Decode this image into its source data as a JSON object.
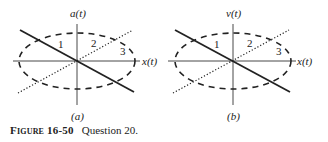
{
  "panels": [
    {
      "id": "a",
      "y_axis_label": "a(t)",
      "x_axis_label": "x(t)",
      "sub_label": "(a)",
      "curve_labels": [
        "1",
        "2",
        "3"
      ],
      "curves": [
        {
          "name": "1",
          "style": "solid",
          "description": "straight line, negative slope through origin"
        },
        {
          "name": "2",
          "style": "dotted",
          "description": "straight line, positive slope through origin"
        },
        {
          "name": "3",
          "style": "dashed",
          "description": "ellipse centered at origin"
        }
      ]
    },
    {
      "id": "b",
      "y_axis_label": "v(t)",
      "x_axis_label": "x(t)",
      "sub_label": "(b)",
      "curve_labels": [
        "1",
        "2",
        "3"
      ],
      "curves": [
        {
          "name": "1",
          "style": "solid",
          "description": "straight line, negative slope through origin"
        },
        {
          "name": "2",
          "style": "dotted",
          "description": "straight line, positive slope through origin"
        },
        {
          "name": "3",
          "style": "dashed",
          "description": "ellipse centered at origin"
        }
      ]
    }
  ],
  "caption": {
    "title": "Figure 16-50",
    "text": "Question 20."
  },
  "colors": {
    "ink": "#222222",
    "background": "#ffffff"
  }
}
